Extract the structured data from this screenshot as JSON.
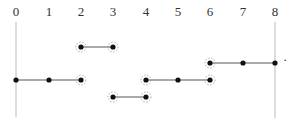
{
  "axis": {
    "ticks": [
      "0",
      "1",
      "2",
      "3",
      "4",
      "5",
      "6",
      "7",
      "8"
    ],
    "tick_x": [
      16,
      49,
      81,
      113,
      146,
      178,
      210,
      243,
      275
    ],
    "label_y": 16,
    "vertical_lines": [
      {
        "at": "0",
        "x": 16,
        "y1": 22,
        "y2": 117
      },
      {
        "at": "8",
        "x": 275,
        "y1": 22,
        "y2": 118
      }
    ]
  },
  "segments": [
    {
      "name": "segment-0-2",
      "from": 0,
      "to": 2,
      "y": 80,
      "points": [
        0,
        1,
        2
      ],
      "open_ends": [
        2
      ]
    },
    {
      "name": "segment-2-3",
      "from": 2,
      "to": 3,
      "y": 47,
      "points": [
        2,
        3
      ],
      "open_ends": [
        2,
        3
      ]
    },
    {
      "name": "segment-3-4",
      "from": 3,
      "to": 4,
      "y": 97,
      "points": [
        3,
        4
      ],
      "open_ends": [
        3,
        4
      ]
    },
    {
      "name": "segment-4-6",
      "from": 4,
      "to": 6,
      "y": 80,
      "points": [
        4,
        5,
        6
      ],
      "open_ends": [
        4,
        6
      ]
    },
    {
      "name": "segment-6-8",
      "from": 6,
      "to": 8,
      "y": 63,
      "points": [
        6,
        7,
        8
      ],
      "open_ends": [
        6
      ]
    }
  ],
  "trailing_mark": {
    "text": "·",
    "x": 283,
    "y": 64
  },
  "colors": {
    "line": "#555555",
    "point": "#111111",
    "ring": "#999999",
    "axis": "#bbbbbb"
  }
}
